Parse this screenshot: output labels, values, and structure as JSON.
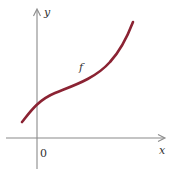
{
  "diagram": {
    "type": "function-graph",
    "axes": {
      "x_label": "x",
      "y_label": "y",
      "origin_label": "0"
    },
    "curve": {
      "label": "f",
      "color": "#8b2333",
      "description": "increasing curve, concave down then concave up (inflection point), crossing y-axis above origin"
    },
    "axis_color": "#888888"
  }
}
